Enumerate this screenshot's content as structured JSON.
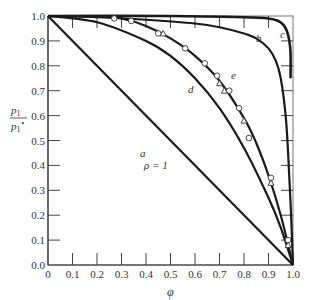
{
  "chart_data": {
    "type": "line",
    "title": "",
    "xlabel": "φ",
    "ylabel": "p1 / p1°",
    "xlim": [
      0,
      1.0
    ],
    "ylim": [
      0,
      1.0
    ],
    "grid": false,
    "x_ticks": [
      "0",
      "0.1",
      "0.2",
      "0.3",
      "0.4",
      "0.5",
      "0.6",
      "0.7",
      "0.8",
      "0.9",
      "1.0"
    ],
    "y_ticks": [
      "0.0",
      "0.1",
      "0.2",
      "0.3",
      "0.4",
      "0.5",
      "0.6",
      "0.7",
      "0.8",
      "0.9",
      "1.0"
    ],
    "annotations": [
      "ρ = 1"
    ],
    "series": [
      {
        "name": "a",
        "label": "a",
        "style": "line",
        "x": [
          0,
          1.0
        ],
        "y": [
          1.0,
          0.0
        ]
      },
      {
        "name": "b",
        "label": "b",
        "style": "line",
        "x": [
          0,
          0.2,
          0.4,
          0.6,
          0.7,
          0.8,
          0.85,
          0.9,
          0.93,
          0.95,
          0.97,
          0.98,
          0.99,
          1.0
        ],
        "y": [
          1.0,
          0.995,
          0.985,
          0.97,
          0.955,
          0.93,
          0.91,
          0.87,
          0.82,
          0.75,
          0.6,
          0.45,
          0.25,
          0.0
        ]
      },
      {
        "name": "c",
        "label": "c",
        "style": "line",
        "x": [
          0.0,
          0.5,
          0.8,
          0.9,
          0.94,
          0.96,
          0.975,
          0.985,
          0.99,
          0.99
        ],
        "y": [
          1.0,
          1.0,
          0.995,
          0.99,
          0.98,
          0.965,
          0.94,
          0.9,
          0.85,
          0.75
        ]
      },
      {
        "name": "d",
        "label": "d",
        "style": "line",
        "x": [
          0,
          0.2,
          0.4,
          0.5,
          0.6,
          0.7,
          0.8,
          0.9,
          0.95,
          1.0
        ],
        "y": [
          1.0,
          0.975,
          0.9,
          0.84,
          0.75,
          0.63,
          0.47,
          0.27,
          0.15,
          0.0
        ]
      },
      {
        "name": "e",
        "label": "e",
        "style": "line",
        "x": [
          0.2,
          0.3,
          0.4,
          0.5,
          0.6,
          0.7,
          0.8,
          0.85,
          0.9,
          0.95,
          1.0
        ],
        "y": [
          1.0,
          0.99,
          0.96,
          0.91,
          0.84,
          0.74,
          0.59,
          0.49,
          0.36,
          0.2,
          0.0
        ]
      },
      {
        "name": "circles",
        "label": "○ experimental",
        "style": "marker-circle",
        "x": [
          0.27,
          0.34,
          0.45,
          0.56,
          0.64,
          0.69,
          0.74,
          0.78,
          0.82,
          0.91,
          0.98
        ],
        "y": [
          0.99,
          0.98,
          0.93,
          0.87,
          0.81,
          0.76,
          0.7,
          0.63,
          0.51,
          0.35,
          0.1
        ]
      },
      {
        "name": "triangles",
        "label": "△ experimental",
        "style": "marker-triangle",
        "x": [
          0.47,
          0.7,
          0.72,
          0.8,
          0.91,
          0.98
        ],
        "y": [
          0.93,
          0.73,
          0.7,
          0.58,
          0.33,
          0.08
        ]
      }
    ]
  },
  "labels": {
    "x_axis_title": "φ",
    "y_axis_num": "p",
    "y_axis_num_sub": "1",
    "y_axis_den": "p",
    "y_axis_den_sub": "1",
    "y_axis_den_sup": "∘",
    "rho": "ρ = 1",
    "curve_a": "a",
    "curve_b": "b",
    "curve_c": "c",
    "curve_d": "d",
    "curve_e": "e"
  },
  "ticks": {
    "x": [
      "0",
      "0.1",
      "0.2",
      "0.3",
      "0.4",
      "0.5",
      "0.6",
      "0.7",
      "0.8",
      "0.9",
      "1.0"
    ],
    "y": [
      "0.0",
      "0.1",
      "0.2",
      "0.3",
      "0.4",
      "0.5",
      "0.6",
      "0.7",
      "0.8",
      "0.9",
      "1.0"
    ]
  }
}
